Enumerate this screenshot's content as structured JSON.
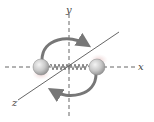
{
  "diagram": {
    "type": "rotating-diatomic-molecule",
    "axes": {
      "x": {
        "label": "x",
        "style": "dashed"
      },
      "y": {
        "label": "y",
        "style": "dashed"
      },
      "z": {
        "label": "z",
        "style": "solid"
      }
    },
    "atoms": [
      {
        "name": "left-atom"
      },
      {
        "name": "right-atom"
      }
    ],
    "bond": {
      "type": "spring"
    },
    "rotation_arrows": [
      {
        "name": "top-arrow",
        "direction": "clockwise"
      },
      {
        "name": "bottom-arrow",
        "direction": "clockwise"
      }
    ],
    "colors": {
      "axis": "#555555",
      "arrow": "#777777",
      "atom_fill": "#c8c8c8",
      "atom_shadow": "#e6c9c9",
      "spring": "#666666"
    }
  }
}
